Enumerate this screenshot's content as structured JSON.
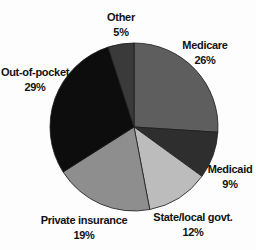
{
  "chart_data": {
    "type": "pie",
    "title": "",
    "start": "top",
    "direction": "clockwise",
    "slices": [
      {
        "label": "Medicare",
        "value": 26,
        "value_label": "26%",
        "color": "#5e5e5e"
      },
      {
        "label": "Medicaid",
        "value": 9,
        "value_label": "9%",
        "color": "#2e2e2e"
      },
      {
        "label": "State/local govt.",
        "value": 12,
        "value_label": "12%",
        "color": "#bcbcbc"
      },
      {
        "label": "Private insurance",
        "value": 19,
        "value_label": "19%",
        "color": "#8e8e8e"
      },
      {
        "label": "Out-of-pocket",
        "value": 29,
        "value_label": "29%",
        "color": "#0d0d0d"
      },
      {
        "label": "Other",
        "value": 5,
        "value_label": "5%",
        "color": "#3a3a3a"
      }
    ]
  }
}
